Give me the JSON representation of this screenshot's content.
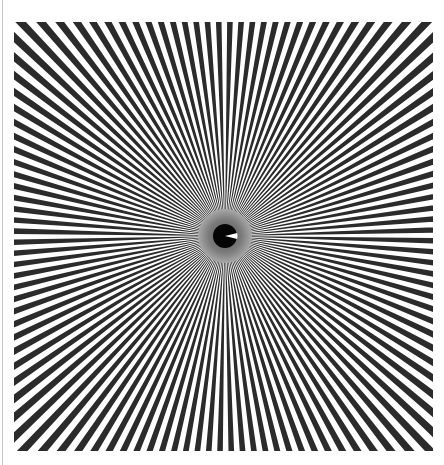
{
  "image": {
    "subject": "Siemens star test pattern",
    "caption": "Radial spoke resolution target",
    "colors": {
      "background": "#ffffff",
      "spoke": "#2b2b2b",
      "border_line": "#c8c8c8",
      "center_ring_outer": "#9a9a9a",
      "center_ring_inner": "#6e6e6e",
      "center_disk": "#050505",
      "center_wedge": "#ffffff"
    },
    "pattern": {
      "spoke_count": 120,
      "spoke_fraction": 0.5,
      "center_x": 211,
      "center_y": 214,
      "gray_ring_radius": 27,
      "black_disk_radius": 12,
      "wedge_angle_deg": 28
    }
  }
}
